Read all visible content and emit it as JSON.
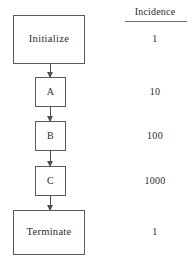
{
  "figure": {
    "type": "flowchart",
    "orientation": "vertical",
    "background_color": "#ffffff",
    "stroke_color": "#5a5a58",
    "text_color": "#2b2b2b"
  },
  "flow": {
    "nodes": [
      {
        "id": "initialize",
        "label": "Initialize",
        "shape": "rectangle",
        "size": "large"
      },
      {
        "id": "a",
        "label": "A",
        "shape": "rectangle",
        "size": "small"
      },
      {
        "id": "b",
        "label": "B",
        "shape": "rectangle",
        "size": "small"
      },
      {
        "id": "c",
        "label": "C",
        "shape": "rectangle",
        "size": "small"
      },
      {
        "id": "terminate",
        "label": "Terminate",
        "shape": "rectangle",
        "size": "large"
      }
    ],
    "edges": [
      {
        "from": "initialize",
        "to": "a",
        "style": "solid-arrow-down"
      },
      {
        "from": "a",
        "to": "b",
        "style": "solid-arrow-down"
      },
      {
        "from": "b",
        "to": "c",
        "style": "solid-arrow-down"
      },
      {
        "from": "c",
        "to": "terminate",
        "style": "solid-arrow-down"
      }
    ]
  },
  "incidence": {
    "header": "Incidence",
    "underlined": true,
    "values": [
      "1",
      "10",
      "100",
      "1000",
      "1"
    ]
  },
  "chart_data": {
    "type": "table",
    "title": "",
    "columns": [
      "Step",
      "Incidence"
    ],
    "rows": [
      [
        "Initialize",
        1
      ],
      [
        "A",
        10
      ],
      [
        "B",
        100
      ],
      [
        "C",
        1000
      ],
      [
        "Terminate",
        1
      ]
    ]
  }
}
